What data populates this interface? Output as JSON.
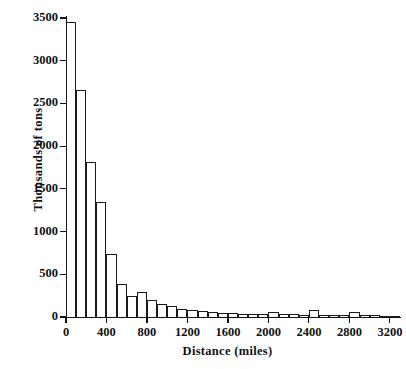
{
  "chart_data": {
    "type": "bar",
    "subtype": "histogram",
    "title": "",
    "xlabel": "Distance (miles)",
    "ylabel": "Thousands of tons",
    "xlim": [
      0,
      3300
    ],
    "ylim": [
      0,
      3500
    ],
    "bin_width": 100,
    "grid": false,
    "legend": null,
    "x_tick_labels": [
      "0",
      "400",
      "800",
      "1200",
      "1600",
      "2000",
      "2400",
      "2800",
      "3200"
    ],
    "x_tick_values": [
      0,
      400,
      800,
      1200,
      1600,
      2000,
      2400,
      2800,
      3200
    ],
    "y_tick_labels": [
      "0",
      "500",
      "1000",
      "1500",
      "2000",
      "2500",
      "3000",
      "3500"
    ],
    "y_tick_values": [
      0,
      500,
      1000,
      1500,
      2000,
      2500,
      3000,
      3500
    ],
    "bin_starts": [
      0,
      100,
      200,
      300,
      400,
      500,
      600,
      700,
      800,
      900,
      1000,
      1100,
      1200,
      1300,
      1400,
      1500,
      1600,
      1700,
      1800,
      1900,
      2000,
      2100,
      2200,
      2300,
      2400,
      2500,
      2600,
      2700,
      2800,
      2900,
      3000,
      3100,
      3200
    ],
    "categories": [
      "0-100",
      "100-200",
      "200-300",
      "300-400",
      "400-500",
      "500-600",
      "600-700",
      "700-800",
      "800-900",
      "900-1000",
      "1000-1100",
      "1100-1200",
      "1200-1300",
      "1300-1400",
      "1400-1500",
      "1500-1600",
      "1600-1700",
      "1700-1800",
      "1800-1900",
      "1900-2000",
      "2000-2100",
      "2100-2200",
      "2200-2300",
      "2300-2400",
      "2400-2500",
      "2500-2600",
      "2600-2700",
      "2700-2800",
      "2800-2900",
      "2900-3000",
      "3000-3100",
      "3100-3200",
      "3200-3300"
    ],
    "values": [
      3450,
      2660,
      1820,
      1350,
      740,
      390,
      245,
      290,
      195,
      155,
      125,
      95,
      80,
      65,
      55,
      48,
      42,
      40,
      36,
      34,
      60,
      32,
      30,
      28,
      80,
      26,
      24,
      22,
      55,
      20,
      18,
      16,
      8
    ]
  },
  "axes": {
    "x_title": "Distance (miles)",
    "y_title": "Thousands of tons"
  }
}
